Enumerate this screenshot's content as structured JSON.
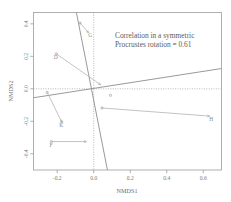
{
  "chart_data": {
    "type": "scatter",
    "title": "",
    "annotation_lines": [
      "Correlation in a symmetric",
      "Procrustes rotation = 0.61"
    ],
    "annotation_full": "Correlation in a symmetric Procrustes rotation = 0.61",
    "correlation": 0.61,
    "xlabel": "NMDS1",
    "ylabel": "NMDS2",
    "xlim": [
      -0.33,
      0.7
    ],
    "ylim": [
      -0.5,
      0.47
    ],
    "xticks": [
      -0.2,
      0.0,
      0.2,
      0.4,
      0.6
    ],
    "xticklabels": [
      "-0.2",
      "0.0",
      "0.2",
      "0.4",
      "0.6"
    ],
    "yticks": [
      -0.4,
      -0.2,
      0.0,
      0.2,
      0.4
    ],
    "yticklabels": [
      "-0.4",
      "-0.2",
      "0.0",
      "0.2",
      "0.4"
    ],
    "grid": false,
    "zero_lines": {
      "horizontal": 0.0,
      "vertical": 0.0,
      "style": "dotted",
      "color": "#9a9a9a"
    },
    "rotation_axes": [
      {
        "name": "major-axis",
        "x1": -0.095,
        "y1": 0.47,
        "x2": 0.075,
        "y2": -0.5,
        "color": "#8d8d8d"
      },
      {
        "name": "minor-axis",
        "x1": -0.33,
        "y1": -0.055,
        "x2": 0.7,
        "y2": 0.125,
        "color": "#8d8d8d"
      }
    ],
    "arrow_color": "#b4b4b4",
    "point_color": "#9e9e9e",
    "points": [
      {
        "label": "G",
        "from_x": -0.075,
        "from_y": 0.405,
        "to_x": -0.028,
        "to_y": 0.345
      },
      {
        "label": "D",
        "from_x": -0.205,
        "from_y": 0.215,
        "to_x": 0.038,
        "to_y": 0.025
      },
      {
        "label": "",
        "from_x": -0.255,
        "from_y": -0.022,
        "to_x": -0.175,
        "to_y": -0.205
      },
      {
        "label": "K",
        "from_x": -0.175,
        "from_y": -0.205,
        "to_x": -0.175,
        "to_y": -0.205
      },
      {
        "label": "F",
        "from_x": -0.232,
        "from_y": -0.325,
        "to_x": -0.04,
        "to_y": -0.325
      },
      {
        "label": "H",
        "from_x": 0.045,
        "from_y": -0.118,
        "to_x": 0.635,
        "to_y": -0.168
      },
      {
        "label": "",
        "from_x": 0.092,
        "from_y": -0.04,
        "to_x": 0.092,
        "to_y": -0.04
      }
    ]
  },
  "labels": {
    "x_axis_title": "NMDS1",
    "y_axis_title": "NMDS2"
  }
}
